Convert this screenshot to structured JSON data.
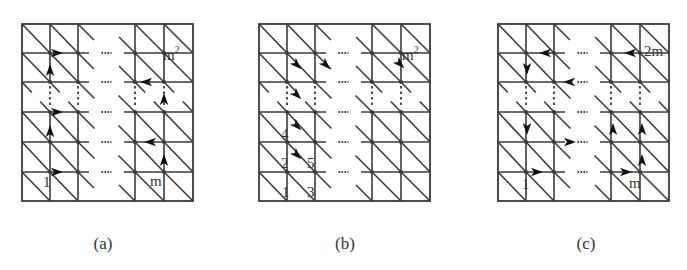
{
  "figure": {
    "stroke_color": "#3a3a3a",
    "background": "#ffffff",
    "rows_y": [
      24,
      53,
      82,
      112,
      142,
      172,
      201
    ],
    "gap_row_index": 2,
    "col_offsets": [
      0,
      28,
      56,
      113,
      142,
      171
    ],
    "gap_col_index": 2
  },
  "panels": [
    {
      "id": "a",
      "caption": "(a)",
      "caption_x": 103,
      "x0": 22,
      "arrow_type": "straight",
      "arrows": [
        {
          "dir": "right",
          "x": 57,
          "y": 53
        },
        {
          "dir": "up",
          "x": 50,
          "y": 70
        },
        {
          "dir": "left",
          "x": 146,
          "y": 82
        },
        {
          "dir": "up",
          "x": 164,
          "y": 99
        },
        {
          "dir": "right",
          "x": 57,
          "y": 112
        },
        {
          "dir": "up",
          "x": 50,
          "y": 131
        },
        {
          "dir": "left",
          "x": 150,
          "y": 142
        },
        {
          "dir": "up",
          "x": 164,
          "y": 160
        },
        {
          "dir": "right",
          "x": 57,
          "y": 172
        }
      ],
      "labels": [
        {
          "text": "1",
          "x": 43,
          "y": 187
        },
        {
          "text": "m",
          "x": 150,
          "y": 186
        },
        {
          "text": "m",
          "x": 163,
          "y": 60,
          "sup": "2"
        }
      ]
    },
    {
      "id": "b",
      "caption": "(b)",
      "caption_x": 345,
      "x0": 259,
      "arrow_type": "diagonal",
      "arrows": [
        {
          "dir": "down-right",
          "x": 297,
          "y": 65
        },
        {
          "dir": "down-right",
          "x": 326,
          "y": 65
        },
        {
          "dir": "down-right",
          "x": 400,
          "y": 64
        },
        {
          "dir": "down-right",
          "x": 297,
          "y": 95
        },
        {
          "dir": "down-right",
          "x": 297,
          "y": 126
        },
        {
          "dir": "down-right",
          "x": 297,
          "y": 155
        }
      ],
      "labels": [
        {
          "text": "4",
          "x": 281,
          "y": 139
        },
        {
          "text": "2",
          "x": 281,
          "y": 168
        },
        {
          "text": "5",
          "x": 307,
          "y": 168
        },
        {
          "text": "1",
          "x": 282,
          "y": 197
        },
        {
          "text": "3",
          "x": 307,
          "y": 197
        },
        {
          "text": "m",
          "x": 402,
          "y": 60,
          "sup": "2"
        }
      ]
    },
    {
      "id": "c",
      "caption": "(c)",
      "caption_x": 586,
      "x0": 498,
      "arrow_type": "straight",
      "arrows": [
        {
          "dir": "left",
          "x": 545,
          "y": 53
        },
        {
          "dir": "left",
          "x": 630,
          "y": 53
        },
        {
          "dir": "down",
          "x": 527,
          "y": 69
        },
        {
          "dir": "left",
          "x": 569,
          "y": 82
        },
        {
          "dir": "down",
          "x": 527,
          "y": 129
        },
        {
          "dir": "up",
          "x": 613,
          "y": 129
        },
        {
          "dir": "up",
          "x": 642,
          "y": 129
        },
        {
          "dir": "right",
          "x": 570,
          "y": 142
        },
        {
          "dir": "up",
          "x": 642,
          "y": 160
        },
        {
          "dir": "right",
          "x": 537,
          "y": 172
        },
        {
          "dir": "right",
          "x": 626,
          "y": 172
        }
      ],
      "labels": [
        {
          "text": "1",
          "x": 522,
          "y": 189
        },
        {
          "text": "m",
          "x": 629,
          "y": 188
        },
        {
          "text": "2m",
          "x": 644,
          "y": 56
        }
      ]
    }
  ]
}
